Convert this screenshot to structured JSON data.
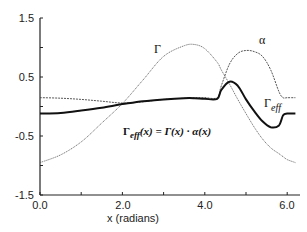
{
  "chart_data": {
    "type": "line",
    "title": "",
    "xlabel": "x (radians)",
    "ylabel": "",
    "xlim": [
      0.0,
      6.283
    ],
    "ylim": [
      -1.5,
      1.5
    ],
    "grid": false,
    "x_ticks": [
      "0.0",
      "2.0",
      "4.0",
      "6.0"
    ],
    "y_ticks": [
      "1.5",
      "0.5",
      "-0.5",
      "-1.5"
    ],
    "annotation": "Γeff(x) = Γ(x) · α(x)",
    "x": [
      0.0,
      0.5,
      1.0,
      1.5,
      2.0,
      2.5,
      3.0,
      3.5,
      3.75,
      4.0,
      4.3,
      4.4,
      4.6,
      4.8,
      5.0,
      5.2,
      5.4,
      5.6,
      5.8,
      5.9,
      6.0,
      6.2
    ],
    "series": [
      {
        "name": "Γ",
        "style": "thin dotted",
        "values": [
          -0.95,
          -0.82,
          -0.6,
          -0.28,
          0.05,
          0.45,
          0.85,
          1.03,
          1.05,
          0.98,
          0.75,
          0.62,
          0.38,
          0.12,
          -0.12,
          -0.35,
          -0.55,
          -0.7,
          -0.8,
          -0.85,
          -0.9,
          -0.95
        ]
      },
      {
        "name": "α",
        "style": "thin dashed",
        "values": [
          0.15,
          0.14,
          0.12,
          0.09,
          0.06,
          0.08,
          0.12,
          0.14,
          0.15,
          0.15,
          0.15,
          0.35,
          0.72,
          0.9,
          0.95,
          0.93,
          0.85,
          0.62,
          0.25,
          0.15,
          0.15,
          0.15
        ]
      },
      {
        "name": "Γeff",
        "style": "thick solid",
        "values": [
          -0.12,
          -0.11,
          -0.07,
          -0.02,
          0.04,
          0.09,
          0.12,
          0.14,
          0.14,
          0.13,
          0.13,
          0.28,
          0.42,
          0.35,
          0.12,
          -0.08,
          -0.25,
          -0.35,
          -0.32,
          -0.15,
          -0.12,
          -0.12
        ]
      }
    ],
    "legend": [
      {
        "label": "Γ",
        "x": 3.1,
        "y": 1.05
      },
      {
        "label": "α",
        "x": 5.3,
        "y": 1.1
      },
      {
        "label": "Γeff",
        "x": 5.75,
        "y": 0.05
      }
    ]
  },
  "labels": {
    "gamma": "Γ",
    "alpha": "α",
    "gamma_eff_main": "Γ",
    "gamma_eff_sub": "eff",
    "eq_left_main": "Γ",
    "eq_left_sub": "eff",
    "eq_right": "(x) = Γ(x) · α(x)",
    "xlabel": "x (radians)",
    "xt0": "0.0",
    "xt1": "2.0",
    "xt2": "4.0",
    "xt3": "6.0",
    "yt0": "1.5",
    "yt1": "0.5",
    "yt2": "-0.5",
    "yt3": "-1.5"
  }
}
